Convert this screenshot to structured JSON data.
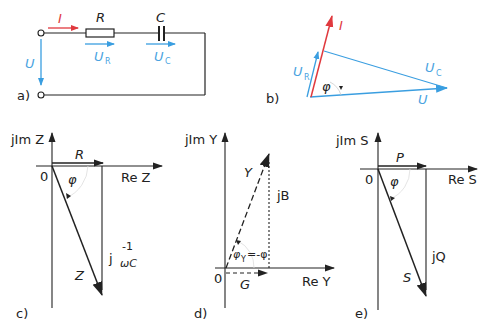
{
  "colors": {
    "current": "#e0393e",
    "voltage": "#3a9ee0",
    "line": "#222222"
  },
  "panel_a": {
    "label": "a)",
    "current": "I",
    "resistor": "R",
    "capacitor": "C",
    "voltage": "U",
    "voltage_r": "U",
    "voltage_r_sub": "R",
    "voltage_c": "U",
    "voltage_c_sub": "C"
  },
  "panel_b": {
    "label": "b)",
    "current": "I",
    "voltage_r": "U",
    "voltage_r_sub": "R",
    "voltage_c": "U",
    "voltage_c_sub": "C",
    "voltage": "U",
    "angle": "φ"
  },
  "panel_c": {
    "label": "c)",
    "y_axis": "jIm Z",
    "x_axis": "Re Z",
    "origin": "0",
    "real": "R",
    "angle": "φ",
    "imag_prefix": "j",
    "imag_num": "-1",
    "imag_den": "ωC",
    "vector": "Z"
  },
  "panel_d": {
    "label": "d)",
    "y_axis": "jIm Y",
    "x_axis": "Re Y",
    "origin": "0",
    "real": "G",
    "imag": "jB",
    "vector": "Y",
    "angle": "φ",
    "angle_sub": "Y",
    "angle_eq": "=-φ"
  },
  "panel_e": {
    "label": "e)",
    "y_axis": "jIm S",
    "x_axis": "Re S",
    "origin": "0",
    "real": "P",
    "angle": "φ",
    "imag": "jQ",
    "vector": "S"
  }
}
